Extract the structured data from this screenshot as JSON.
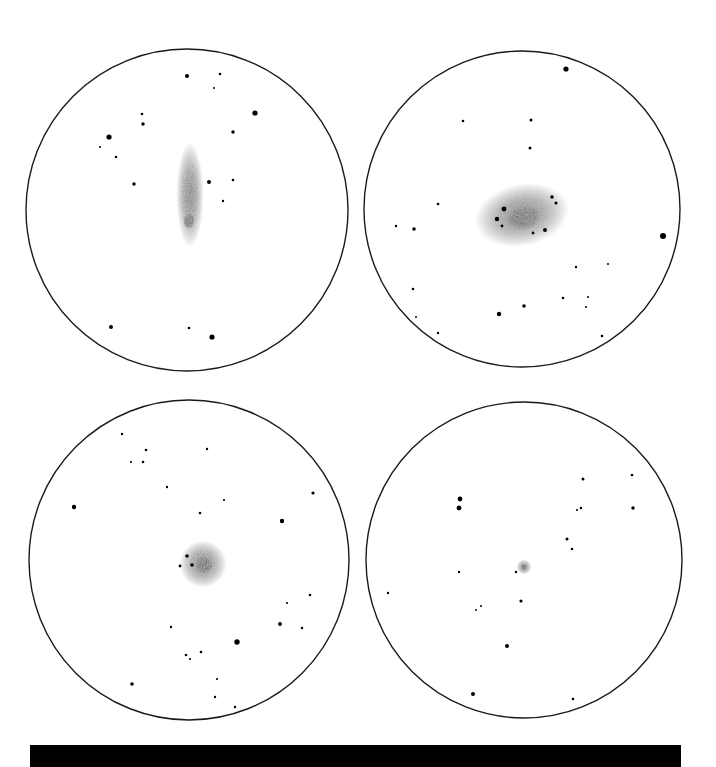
{
  "figure": {
    "background": "#ffffff",
    "ink": "#000000",
    "caption_bar": {
      "color": "#000000",
      "text": ""
    }
  },
  "panels": [
    {
      "name": "top-left",
      "circle": {
        "cx": 187,
        "cy": 210,
        "r": 161
      },
      "object": {
        "type": "edge-on-galaxy",
        "cx": 190,
        "cy": 195,
        "rx": 11,
        "ry": 42,
        "rotate": 0,
        "core": {
          "cx": 189,
          "cy": 221,
          "rx": 6,
          "ry": 8
        }
      },
      "stars": [
        [
          187,
          76,
          2
        ],
        [
          220,
          74,
          1.3
        ],
        [
          214,
          88,
          1
        ],
        [
          255,
          113,
          2.6
        ],
        [
          142,
          114,
          1.3
        ],
        [
          143,
          124,
          1.7
        ],
        [
          109,
          137,
          2.6
        ],
        [
          100,
          147,
          1
        ],
        [
          116,
          157,
          1.3
        ],
        [
          233,
          132,
          1.7
        ],
        [
          134,
          184,
          1.7
        ],
        [
          209,
          182,
          2
        ],
        [
          233,
          180,
          1.3
        ],
        [
          223,
          201,
          1.2
        ],
        [
          111,
          327,
          2
        ],
        [
          189,
          328,
          1.3
        ],
        [
          212,
          337,
          2.6
        ]
      ]
    },
    {
      "name": "top-right",
      "circle": {
        "cx": 522,
        "cy": 209,
        "r": 158
      },
      "object": {
        "type": "spiral-galaxy",
        "cx": 522,
        "cy": 215,
        "rx": 38,
        "ry": 25,
        "rotate": -12,
        "core": {
          "cx": 523,
          "cy": 218,
          "rx": 18,
          "ry": 12
        }
      },
      "galaxy_knots": [
        [
          504,
          209,
          2.4
        ],
        [
          497,
          219,
          2.2
        ],
        [
          552,
          197,
          1.8
        ],
        [
          556,
          203,
          1.6
        ],
        [
          545,
          230,
          2
        ],
        [
          533,
          233,
          1.4
        ],
        [
          502,
          226,
          1.4
        ]
      ],
      "stars": [
        [
          566,
          69,
          2.6
        ],
        [
          463,
          121,
          1.3
        ],
        [
          531,
          120,
          1.5
        ],
        [
          530,
          148,
          1.5
        ],
        [
          438,
          204,
          1.3
        ],
        [
          396,
          226,
          1.2
        ],
        [
          414,
          229,
          1.8
        ],
        [
          663,
          236,
          3
        ],
        [
          576,
          267,
          1.2
        ],
        [
          608,
          264,
          1
        ],
        [
          413,
          289,
          1.3
        ],
        [
          416,
          317,
          1
        ],
        [
          438,
          333,
          1.2
        ],
        [
          499,
          314,
          2.2
        ],
        [
          524,
          306,
          1.8
        ],
        [
          563,
          298,
          1.3
        ],
        [
          588,
          297,
          1
        ],
        [
          586,
          307,
          1
        ],
        [
          602,
          336,
          1.3
        ]
      ]
    },
    {
      "name": "bottom-left",
      "circle": {
        "cx": 189,
        "cy": 560,
        "r": 160
      },
      "object": {
        "type": "globular-or-elliptical",
        "cx": 203,
        "cy": 564,
        "rx": 19,
        "ry": 19,
        "rotate": 0,
        "core": {
          "cx": 204,
          "cy": 565,
          "rx": 9,
          "ry": 9
        }
      },
      "stars": [
        [
          122,
          434,
          1.2
        ],
        [
          146,
          450,
          1.3
        ],
        [
          131,
          462,
          1.1
        ],
        [
          143,
          462,
          1.3
        ],
        [
          207,
          449,
          1.2
        ],
        [
          167,
          487,
          1.2
        ],
        [
          224,
          500,
          1.1
        ],
        [
          74,
          507,
          2.2
        ],
        [
          200,
          513,
          1.3
        ],
        [
          313,
          493,
          1.6
        ],
        [
          282,
          521,
          2.2
        ],
        [
          187,
          556,
          1.8
        ],
        [
          180,
          566,
          1.4
        ],
        [
          192,
          565,
          1.8
        ],
        [
          310,
          595,
          1.3
        ],
        [
          287,
          603,
          1.1
        ],
        [
          280,
          624,
          1.9
        ],
        [
          302,
          628,
          1.2
        ],
        [
          171,
          627,
          1.2
        ],
        [
          237,
          642,
          2.7
        ],
        [
          201,
          652,
          1.3
        ],
        [
          186,
          655,
          1.3
        ],
        [
          190,
          659,
          1.1
        ],
        [
          217,
          679,
          1.1
        ],
        [
          132,
          684,
          1.8
        ],
        [
          215,
          697,
          1.2
        ],
        [
          235,
          707,
          1.2
        ]
      ]
    },
    {
      "name": "bottom-right",
      "circle": {
        "cx": 524,
        "cy": 560,
        "r": 158
      },
      "object": {
        "type": "planetary-nebula",
        "cx": 524,
        "cy": 567,
        "rx": 6,
        "ry": 6,
        "rotate": 0,
        "core": {
          "cx": 524,
          "cy": 567,
          "rx": 3,
          "ry": 3
        }
      },
      "stars": [
        [
          459,
          414,
          2.4
        ],
        [
          583,
          479,
          1.5
        ],
        [
          632,
          475,
          1.3
        ],
        [
          460,
          499,
          2.4
        ],
        [
          459,
          508,
          2.4
        ],
        [
          577,
          510,
          1.1
        ],
        [
          581,
          508,
          1.3
        ],
        [
          633,
          508,
          1.7
        ],
        [
          567,
          539,
          1.5
        ],
        [
          572,
          549,
          1.3
        ],
        [
          459,
          572,
          1.2
        ],
        [
          516,
          572,
          1.2
        ],
        [
          388,
          593,
          1.2
        ],
        [
          521,
          601,
          1.6
        ],
        [
          481,
          606,
          1
        ],
        [
          476,
          610,
          1
        ],
        [
          507,
          646,
          2
        ],
        [
          473,
          694,
          2
        ],
        [
          573,
          699,
          1.3
        ]
      ]
    }
  ]
}
